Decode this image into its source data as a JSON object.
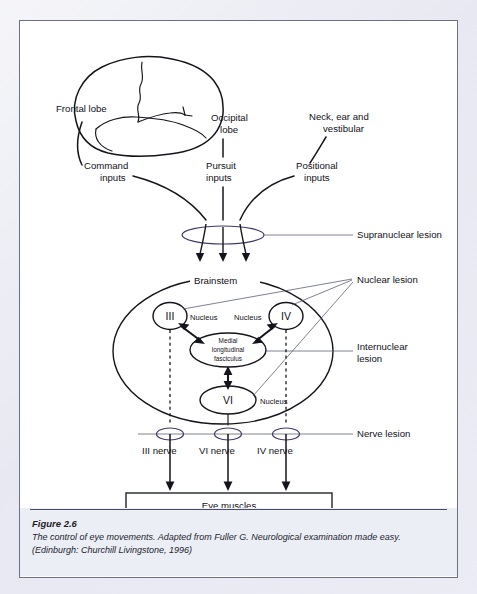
{
  "figure": {
    "number": "Figure 2.6",
    "caption_line1": "The control of eye movements. Adapted from Fuller G. Neurological examination made easy.",
    "caption_line2": "(Edinburgh: Churchill Livingstone, 1996)"
  },
  "diagram": {
    "title": "The control of eye movements",
    "inputs": {
      "frontal_lobe": "Frontal lobe",
      "occipital_lobe_l1": "Occipital",
      "occipital_lobe_l2": "lobe",
      "neck_ear_l1": "Neck, ear and",
      "neck_ear_l2": "vestibular",
      "command_l1": "Command",
      "command_l2": "inputs",
      "pursuit_l1": "Pursuit",
      "pursuit_l2": "inputs",
      "positional_l1": "Positional",
      "positional_l2": "inputs"
    },
    "brainstem_label": "Brainstem",
    "nuclei": [
      {
        "roman": "III",
        "nucleus_label": "Nucleus"
      },
      {
        "roman": "IV",
        "nucleus_label": "Nucleus"
      },
      {
        "roman": "VI",
        "nucleus_label": "Nucleus"
      }
    ],
    "mlf_l1": "Medial",
    "mlf_l2": "longitudinal",
    "mlf_l3": "fasciculus",
    "lesions": {
      "supranuclear": "Supranuclear lesion",
      "nuclear": "Nuclear lesion",
      "internuclear_l1": "Internuclear",
      "internuclear_l2": "lesion",
      "nerve": "Nerve lesion"
    },
    "nerves": [
      {
        "label": "III nerve"
      },
      {
        "label": "VI nerve"
      },
      {
        "label": "IV nerve"
      }
    ],
    "target_box": "Eye muscles",
    "colors": {
      "ink": "#14141c",
      "lesion_ellipse": "#3c3a6b",
      "leader_line": "#54566e",
      "panel_background": "#ffffff",
      "caption_background": "#eceef5",
      "page_matte": "#e9eaf2"
    }
  }
}
